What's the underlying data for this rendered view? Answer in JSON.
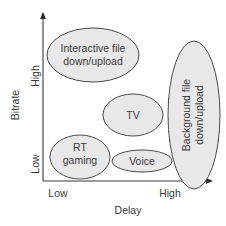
{
  "diagram": {
    "x_axis": {
      "title": "Delay",
      "low_label": "Low",
      "high_label": "High"
    },
    "y_axis": {
      "title": "Bitrate",
      "low_label": "Low",
      "high_label": "High"
    },
    "regions": [
      {
        "id": "interactive",
        "lines": [
          "Interactive file",
          "down/upload"
        ]
      },
      {
        "id": "background",
        "lines": [
          "Background file",
          "down/upload"
        ]
      },
      {
        "id": "tv",
        "lines": [
          "TV"
        ]
      },
      {
        "id": "rt-gaming",
        "lines": [
          "RT",
          "gaming"
        ]
      },
      {
        "id": "voice",
        "lines": [
          "Voice"
        ]
      }
    ],
    "colors": {
      "ellipse_fill": "#e8e8e8",
      "ellipse_stroke": "#4a4a4a",
      "text": "#3a3a3a",
      "axis": "#3a3a3a"
    }
  }
}
